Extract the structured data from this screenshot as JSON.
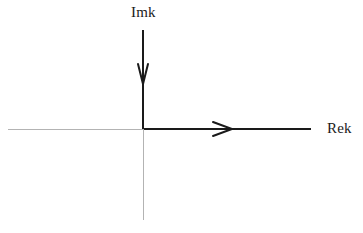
{
  "figure": {
    "width": 363,
    "height": 233,
    "background_color": "#ffffff"
  },
  "labels": {
    "imaginary_axis": "Imk",
    "real_axis": "Rek"
  },
  "colors": {
    "axis_dark": "#1a1a1a",
    "axis_light": "#b3b3b3",
    "text": "#1a1a1a",
    "background": "#ffffff"
  },
  "chart_data": {
    "type": "line",
    "title": "",
    "xlabel": "Rek",
    "ylabel": "Imk",
    "grid": false,
    "legend": null,
    "origin": {
      "x": 143,
      "y": 129
    },
    "axes": [
      {
        "name": "real-axis",
        "label": "Rek",
        "orientation": "horizontal",
        "y": 129,
        "segments": [
          {
            "name": "negative-real",
            "from_x": 8,
            "to_x": 143,
            "color": "#b3b3b3",
            "width": 1
          },
          {
            "name": "positive-real",
            "from_x": 143,
            "to_x": 311,
            "color": "#1a1a1a",
            "width": 2
          }
        ],
        "arrow": {
          "name": "right-arrowhead",
          "direction": "right",
          "style": "open-v",
          "tip_x": 232,
          "tip_y": 129,
          "length": 19,
          "half_width": 7
        }
      },
      {
        "name": "imaginary-axis",
        "label": "Imk",
        "orientation": "vertical",
        "x": 143,
        "segments": [
          {
            "name": "upper-imaginary",
            "from_y": 30,
            "to_y": 129,
            "color": "#1a1a1a",
            "width": 2
          },
          {
            "name": "lower-imaginary",
            "from_y": 129,
            "to_y": 220,
            "color": "#b3b3b3",
            "width": 1
          }
        ],
        "arrow": {
          "name": "down-arrowhead",
          "direction": "down",
          "style": "open-v",
          "tip_x": 143,
          "tip_y": 84,
          "length": 20,
          "half_width": 5
        }
      }
    ]
  }
}
